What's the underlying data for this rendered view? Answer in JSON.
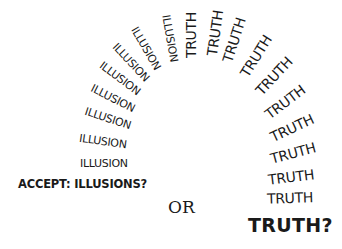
{
  "artwork": {
    "illusion_word": "ILLUSION",
    "truth_word": "TRUTH",
    "accept_label": "ACCEPT: ILLUSIONS?",
    "or_label": "OR",
    "truth_question": "TRUTH?",
    "text_color": "#1a1a1a",
    "background": "#ffffff",
    "illusion_arc": [
      {
        "x": 104,
        "y": 163,
        "angle": 0
      },
      {
        "x": 103,
        "y": 141,
        "angle": 8
      },
      {
        "x": 108,
        "y": 118,
        "angle": 18
      },
      {
        "x": 113,
        "y": 98,
        "angle": 27
      },
      {
        "x": 120,
        "y": 78,
        "angle": 37
      },
      {
        "x": 131,
        "y": 62,
        "angle": 47
      },
      {
        "x": 146,
        "y": 48,
        "angle": 60
      },
      {
        "x": 170,
        "y": 38,
        "angle": 80
      }
    ],
    "truth_arc": [
      {
        "x": 191,
        "y": 35,
        "angle": -90
      },
      {
        "x": 215,
        "y": 33,
        "angle": -82
      },
      {
        "x": 234,
        "y": 40,
        "angle": -72
      },
      {
        "x": 256,
        "y": 56,
        "angle": -58
      },
      {
        "x": 274,
        "y": 76,
        "angle": -47
      },
      {
        "x": 285,
        "y": 102,
        "angle": -37
      },
      {
        "x": 292,
        "y": 128,
        "angle": -25
      },
      {
        "x": 293,
        "y": 153,
        "angle": -15
      },
      {
        "x": 291,
        "y": 177,
        "angle": -7
      },
      {
        "x": 290,
        "y": 198,
        "angle": -2
      }
    ]
  }
}
